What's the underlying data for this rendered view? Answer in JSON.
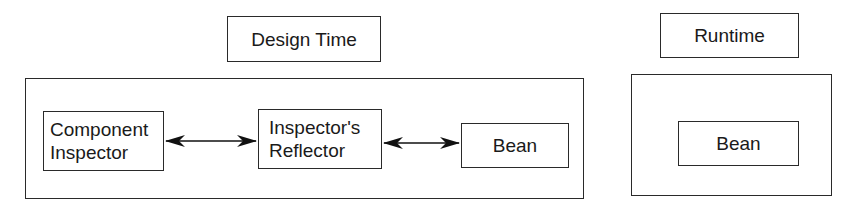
{
  "design_time": {
    "title": "Design Time",
    "nodes": {
      "component_inspector": "Component\nInspector",
      "inspectors_reflector": "Inspector's\nReflector",
      "bean": "Bean"
    },
    "edges": [
      {
        "from": "Component Inspector",
        "to": "Inspector's Reflector",
        "type": "bidirectional"
      },
      {
        "from": "Inspector's Reflector",
        "to": "Bean",
        "type": "bidirectional"
      }
    ]
  },
  "runtime": {
    "title": "Runtime",
    "nodes": {
      "bean": "Bean"
    }
  }
}
